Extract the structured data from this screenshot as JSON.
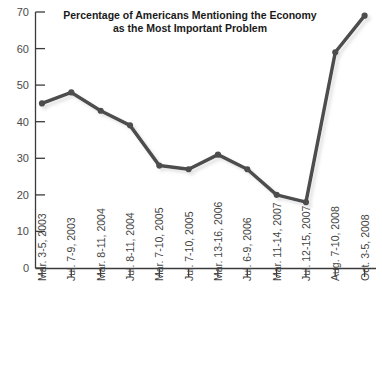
{
  "chart_data": {
    "type": "line",
    "title": "Percentage of Americans Mentioning the Economy as the Most Important Problem",
    "title_line1": "Percentage of Americans Mentioning the Economy",
    "title_line2": "as the Most Important Problem",
    "xlabel": "",
    "ylabel": "",
    "ylim": [
      0,
      70
    ],
    "yticks": [
      0,
      10,
      20,
      30,
      40,
      50,
      60,
      70
    ],
    "ytick_labels": [
      "0",
      "10",
      "20",
      "30",
      "40",
      "50",
      "60",
      "70"
    ],
    "grid": false,
    "legend": "none",
    "categories": [
      "Mar. 3-5, 2003",
      "Jul. 7-9, 2003",
      "Mar. 8-11, 2004",
      "Jul. 8-11, 2004",
      "Mar. 7-10, 2005",
      "Jul. 7-10, 2005",
      "Mar. 13-16, 2006",
      "Jul. 6-9, 2006",
      "Mar. 11-14, 2007",
      "Jul. 12-15, 2007",
      "Aug. 7-10, 2008",
      "Oct. 3-5, 2008"
    ],
    "values": [
      45,
      48,
      43,
      39,
      28,
      27,
      31,
      27,
      20,
      18,
      59,
      69
    ],
    "series_color": "#4d4d4d",
    "marker": "circle",
    "line_width": 3.5
  }
}
